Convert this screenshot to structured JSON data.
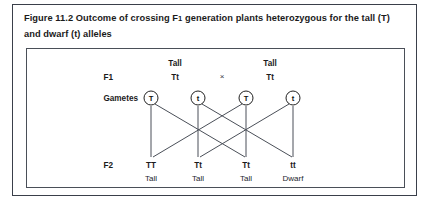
{
  "figure": {
    "title_line1_prefix": "Figure 11.2 Outcome of crossing F",
    "title_line1_sub": "1",
    "title_line1_rest": " generation plants heterozygous for the",
    "title_line2": "tall (T) and dwarf (t) alleles",
    "title_full": "Figure 11.2 Outcome of crossing F1 generation plants heterozygous for the tall (T) and dwarf (t) alleles"
  },
  "diagram": {
    "row_labels": {
      "f1": "F1",
      "gametes": "Gametes",
      "f2": "F2"
    },
    "parents": [
      {
        "phenotype": "Tall",
        "genotype": "Tt"
      },
      {
        "phenotype": "Tall",
        "genotype": "Tt"
      }
    ],
    "cross_symbol": "×",
    "gametes": [
      {
        "allele": "T"
      },
      {
        "allele": "t"
      },
      {
        "allele": "T"
      },
      {
        "allele": "t"
      }
    ],
    "offspring": [
      {
        "genotype": "TT",
        "phenotype": "Tall"
      },
      {
        "genotype": "Tt",
        "phenotype": "Tall"
      },
      {
        "genotype": "Tt",
        "phenotype": "Tall"
      },
      {
        "genotype": "tt",
        "phenotype": "Dwarf"
      }
    ],
    "colors": {
      "border": "#3a3f4a",
      "inner_border": "#4a4f58",
      "line": "#4a4f58",
      "text": "#1b1b1b",
      "background": "#ffffff"
    }
  }
}
